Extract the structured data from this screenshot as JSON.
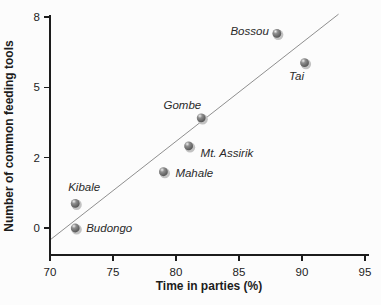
{
  "figure": {
    "background": "#fcfcfc",
    "axis_color": "#1c1c1c",
    "text_color": "#1c1c1c",
    "trendline_color": "#8f8f8f",
    "marker_dark": "#474747",
    "marker_mid": "#8f8f8f",
    "marker_highlight": "#efefef",
    "marker_ring": "#c2c2c2"
  },
  "chart_data": {
    "type": "scatter",
    "title": "",
    "xlabel": "Time in parties (%)",
    "ylabel": "Number of common feeding tools",
    "xlim": [
      70,
      95
    ],
    "x_ticks": [
      70,
      75,
      80,
      85,
      90,
      95
    ],
    "y_ticks": [
      0,
      2,
      5,
      8
    ],
    "y_scale_note": "y-axis tick labels 0, 2, 5, 8 are drawn evenly spaced (non-linear scale as printed)",
    "grid": false,
    "legend": "none",
    "points": [
      {
        "site": "Bossou",
        "x": 88,
        "y": 7.3,
        "label_anchor": "end",
        "label_dx": -8,
        "label_dy": 2
      },
      {
        "site": "Tai",
        "x": 90.2,
        "y": 6.05,
        "label_anchor": "middle",
        "label_dx": -8,
        "label_dy": 17
      },
      {
        "site": "Gombe",
        "x": 82,
        "y": 3.7,
        "label_anchor": "end",
        "label_dx": 0,
        "label_dy": -9
      },
      {
        "site": "Mt. Assirik",
        "x": 81,
        "y": 2.5,
        "label_anchor": "start",
        "label_dx": 12,
        "label_dy": 11
      },
      {
        "site": "Mahale",
        "x": 79,
        "y": 1.6,
        "label_anchor": "start",
        "label_dx": 12,
        "label_dy": 5
      },
      {
        "site": "Kibale",
        "x": 72,
        "y": 0.7,
        "label_anchor": "middle",
        "label_dx": 9,
        "label_dy": -12
      },
      {
        "site": "Budongo",
        "x": 72,
        "y": 0,
        "label_anchor": "start",
        "label_dx": 11,
        "label_dy": 4
      }
    ],
    "trendline": {
      "x1": 70,
      "y1": -0.34,
      "x2": 92.9,
      "y2": 8.12
    }
  }
}
